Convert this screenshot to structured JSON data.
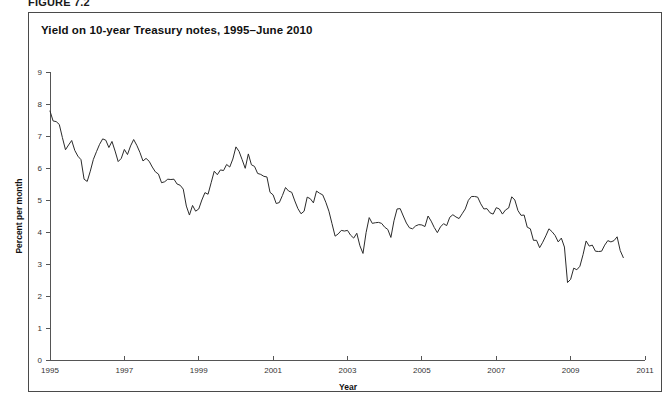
{
  "figure": {
    "label": "FIGURE 7.2"
  },
  "chart": {
    "title": "Yield on 10-year Treasury notes, 1995–June 2010"
  },
  "chart_data": {
    "type": "line",
    "title": "Yield on 10-year Treasury notes, 1995–June 2010",
    "xlabel": "Year",
    "ylabel": "Percent per month",
    "xlim": [
      1995,
      2011
    ],
    "ylim": [
      0,
      9
    ],
    "xticks": [
      1995,
      1997,
      1999,
      2001,
      2003,
      2005,
      2007,
      2009,
      2011
    ],
    "xtick_labels": [
      "1995",
      "1997",
      "1999",
      "2001",
      "2003",
      "2005",
      "2007",
      "2009",
      "2011"
    ],
    "yticks": [
      0,
      1,
      2,
      3,
      4,
      5,
      6,
      7,
      8,
      9
    ],
    "ytick_labels": [
      "0",
      "1",
      "2",
      "3",
      "4",
      "5",
      "6",
      "7",
      "8",
      "9"
    ],
    "grid": false,
    "legend": false,
    "series": [
      {
        "name": "10-year Treasury note yield",
        "color": "#2b2b2b",
        "x_start": 1995.0,
        "x_step": 0.0833333,
        "values": [
          7.78,
          7.47,
          7.45,
          7.36,
          6.95,
          6.57,
          6.72,
          6.86,
          6.55,
          6.37,
          6.26,
          5.65,
          5.58,
          5.9,
          6.27,
          6.51,
          6.74,
          6.91,
          6.87,
          6.64,
          6.83,
          6.53,
          6.2,
          6.3,
          6.58,
          6.42,
          6.69,
          6.89,
          6.71,
          6.49,
          6.22,
          6.3,
          6.21,
          6.03,
          5.88,
          5.81,
          5.54,
          5.57,
          5.65,
          5.64,
          5.65,
          5.5,
          5.46,
          5.34,
          4.81,
          4.53,
          4.83,
          4.65,
          4.72,
          5.0,
          5.23,
          5.18,
          5.54,
          5.9,
          5.79,
          5.94,
          5.92,
          6.11,
          6.03,
          6.28,
          6.66,
          6.52,
          6.26,
          5.99,
          6.44,
          6.1,
          6.05,
          5.83,
          5.8,
          5.74,
          5.72,
          5.24,
          5.16,
          4.89,
          4.92,
          5.14,
          5.39,
          5.28,
          5.24,
          4.97,
          4.73,
          4.57,
          4.65,
          5.09,
          5.04,
          4.91,
          5.28,
          5.21,
          5.16,
          4.93,
          4.65,
          4.26,
          3.87,
          3.94,
          4.05,
          4.03,
          4.05,
          3.9,
          3.81,
          3.96,
          3.57,
          3.33,
          3.98,
          4.45,
          4.27,
          4.29,
          4.3,
          4.27,
          4.15,
          4.08,
          3.83,
          4.35,
          4.72,
          4.73,
          4.5,
          4.28,
          4.13,
          4.1,
          4.19,
          4.23,
          4.22,
          4.17,
          4.5,
          4.34,
          4.14,
          3.98,
          4.16,
          4.26,
          4.2,
          4.46,
          4.54,
          4.47,
          4.42,
          4.57,
          4.72,
          4.99,
          5.11,
          5.11,
          5.09,
          4.88,
          4.72,
          4.73,
          4.6,
          4.56,
          4.76,
          4.72,
          4.56,
          4.69,
          4.75,
          5.1,
          5.0,
          4.67,
          4.52,
          4.53,
          4.15,
          4.1,
          3.74,
          3.74,
          3.51,
          3.68,
          3.88,
          4.1,
          4.01,
          3.89,
          3.69,
          3.81,
          3.53,
          2.42,
          2.52,
          2.87,
          2.82,
          2.93,
          3.29,
          3.72,
          3.56,
          3.59,
          3.4,
          3.39,
          3.4,
          3.59,
          3.73,
          3.69,
          3.73,
          3.85,
          3.42,
          3.2
        ]
      }
    ]
  }
}
